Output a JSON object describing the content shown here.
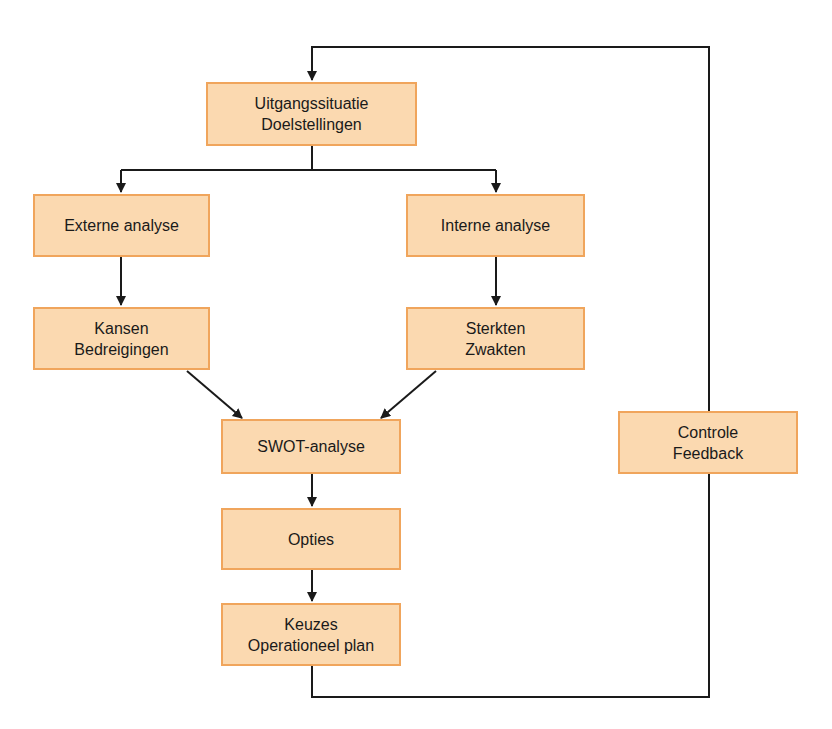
{
  "diagram": {
    "title_partial": "",
    "colors": {
      "box_fill": "#fbd9b0",
      "box_border": "#f0a55c",
      "line": "#1a1a1a",
      "text": "#1a1a1a"
    },
    "nodes": {
      "start": {
        "line1": "Uitgangssituatie",
        "line2": "Doelstellingen"
      },
      "external": {
        "line1": "Externe analyse"
      },
      "internal": {
        "line1": "Interne analyse"
      },
      "opportunities": {
        "line1": "Kansen",
        "line2": "Bedreigingen"
      },
      "strengths": {
        "line1": "Sterkten",
        "line2": "Zwakten"
      },
      "swot": {
        "line1": "SWOT-analyse"
      },
      "options": {
        "line1": "Opties"
      },
      "choices": {
        "line1": "Keuzes",
        "line2": "Operationeel plan"
      },
      "control": {
        "line1": "Controle",
        "line2": "Feedback"
      }
    },
    "edges": [
      [
        "start",
        "external"
      ],
      [
        "start",
        "internal"
      ],
      [
        "external",
        "opportunities"
      ],
      [
        "internal",
        "strengths"
      ],
      [
        "opportunities",
        "swot"
      ],
      [
        "strengths",
        "swot"
      ],
      [
        "swot",
        "options"
      ],
      [
        "options",
        "choices"
      ],
      [
        "choices",
        "control"
      ],
      [
        "control",
        "start"
      ]
    ]
  }
}
